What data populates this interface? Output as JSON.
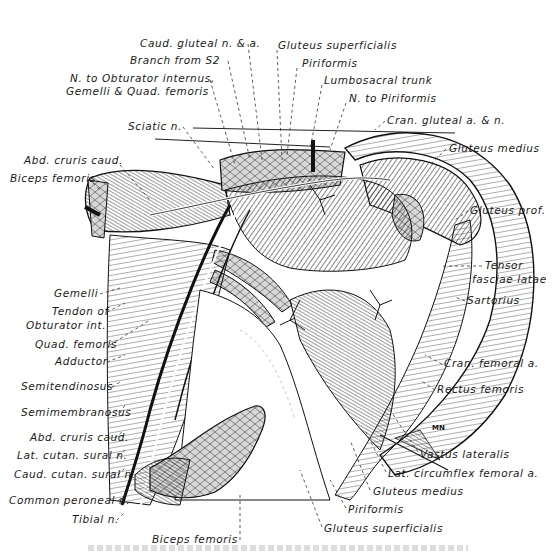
{
  "figure": {
    "signature": "MN",
    "labels": [
      {
        "id": "caud-gluteal",
        "text": "Caud. gluteal n. & a.",
        "x": 160,
        "y": 38
      },
      {
        "id": "branch-s2",
        "text": "Branch from S2",
        "x": 130,
        "y": 55
      },
      {
        "id": "n-obturator-1",
        "text": "N. to Obturator internus,",
        "x": 70,
        "y": 73
      },
      {
        "id": "n-obturator-2",
        "text": "Gemelli & Quad. femoris",
        "x": 66,
        "y": 86
      },
      {
        "id": "sciatic",
        "text": "Sciatic n.",
        "x": 128,
        "y": 121
      },
      {
        "id": "abd-cruris-caud-top",
        "text": "Abd. cruris caud.",
        "x": 24,
        "y": 155
      },
      {
        "id": "biceps-femoris-top",
        "text": "Biceps femoris",
        "x": 10,
        "y": 173
      },
      {
        "id": "gluteus-superficialis-top",
        "text": "Gluteus superficialis",
        "x": 278,
        "y": 40
      },
      {
        "id": "piriformis-top",
        "text": "Piriformis",
        "x": 302,
        "y": 58
      },
      {
        "id": "lumbosacral-trunk",
        "text": "Lumbosacral trunk",
        "x": 324,
        "y": 75
      },
      {
        "id": "n-piriformis",
        "text": "N. to Piriformis",
        "x": 349,
        "y": 93
      },
      {
        "id": "cran-gluteal",
        "text": "Cran. gluteal a. & n.",
        "x": 387,
        "y": 115
      },
      {
        "id": "gluteus-medius-top",
        "text": "Gluteus medius",
        "x": 449,
        "y": 143
      },
      {
        "id": "gluteus-prof",
        "text": "Gluteus prof.",
        "x": 470,
        "y": 205
      },
      {
        "id": "tensor-1",
        "text": "Tensor",
        "x": 485,
        "y": 260
      },
      {
        "id": "tensor-2",
        "text": "fasciae latae",
        "x": 472,
        "y": 274
      },
      {
        "id": "sartorius",
        "text": "Sartorius",
        "x": 467,
        "y": 295
      },
      {
        "id": "cran-femoral",
        "text": "Cran. femoral a.",
        "x": 444,
        "y": 358
      },
      {
        "id": "rectus-femoris",
        "text": "Rectus femoris",
        "x": 437,
        "y": 384
      },
      {
        "id": "gemelli",
        "text": "Gemelli",
        "x": 54,
        "y": 288
      },
      {
        "id": "tendon-obturator-1",
        "text": "Tendon of",
        "x": 52,
        "y": 306
      },
      {
        "id": "tendon-obturator-2",
        "text": "Obturator int.",
        "x": 26,
        "y": 320
      },
      {
        "id": "quad-femoris",
        "text": "Quad. femoris",
        "x": 35,
        "y": 339
      },
      {
        "id": "adductor",
        "text": "Adductor",
        "x": 55,
        "y": 356
      },
      {
        "id": "semitendinosus",
        "text": "Semitendinosus",
        "x": 21,
        "y": 381
      },
      {
        "id": "semimembranosus",
        "text": "Semimembranosus",
        "x": 21,
        "y": 407
      },
      {
        "id": "abd-cruris-caud-bottom",
        "text": "Abd. cruris caud.",
        "x": 30,
        "y": 432
      },
      {
        "id": "lat-cutan-sural",
        "text": "Lat. cutan. sural n.",
        "x": 17,
        "y": 450
      },
      {
        "id": "caud-cutan-sural",
        "text": "Caud. cutan. sural n.",
        "x": 14,
        "y": 469
      },
      {
        "id": "common-peroneal",
        "text": "Common peroneal n.",
        "x": 9,
        "y": 495
      },
      {
        "id": "tibial",
        "text": "Tibial n.",
        "x": 72,
        "y": 514
      },
      {
        "id": "biceps-femoris-bottom",
        "text": "Biceps femoris",
        "x": 152,
        "y": 534
      },
      {
        "id": "vastus-lateralis",
        "text": "Vastus lateralis",
        "x": 420,
        "y": 449
      },
      {
        "id": "lat-circumflex",
        "text": "Lat. circumflex femoral a.",
        "x": 388,
        "y": 468
      },
      {
        "id": "gluteus-medius-bottom",
        "text": "Gluteus medius",
        "x": 373,
        "y": 486
      },
      {
        "id": "piriformis-bottom",
        "text": "Piriformis",
        "x": 348,
        "y": 504
      },
      {
        "id": "gluteus-superficialis-bottom",
        "text": "Gluteus superficialis",
        "x": 324,
        "y": 523
      }
    ]
  }
}
